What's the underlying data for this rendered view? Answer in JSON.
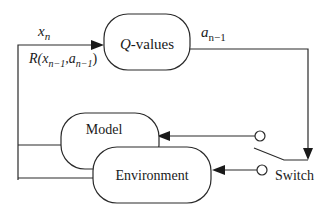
{
  "diagram": {
    "type": "block-diagram",
    "nodes": {
      "q_values": {
        "label_prefix": "Q",
        "label_suffix": "-values"
      },
      "model": {
        "label": "Model"
      },
      "environment": {
        "label": "Environment"
      }
    },
    "labels": {
      "state": {
        "base": "x",
        "sub": "n"
      },
      "reward": {
        "base": "R(x",
        "sub1": "n−1",
        "mid": ",a",
        "sub2": "n−1",
        "end": ")"
      },
      "action": {
        "base": "a",
        "sub": "n−1"
      },
      "switch": "Switch"
    },
    "colors": {
      "stroke": "#2a2a2a",
      "background": "#ffffff",
      "text": "#1a1a1a"
    }
  }
}
